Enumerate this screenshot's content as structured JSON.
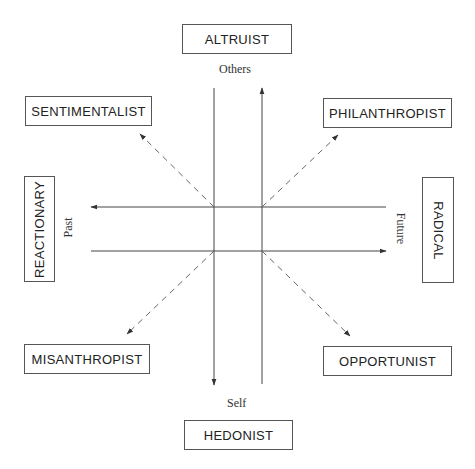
{
  "diagram": {
    "type": "orientation-quadrant",
    "boxes": {
      "top": "ALTRUIST",
      "bottom": "HEDONIST",
      "left": "REACTIONARY",
      "right": "RADICAL",
      "top_left": "SENTIMENTALIST",
      "top_right": "PHILANTHROPIST",
      "bottom_left": "MISANTHROPIST",
      "bottom_right": "OPPORTUNIST"
    },
    "axis_labels": {
      "up": "Others",
      "down": "Self",
      "left": "Past",
      "right": "Future"
    },
    "colors": {
      "line": "#444444",
      "dashed": "#777777",
      "box_border": "#555555"
    }
  }
}
